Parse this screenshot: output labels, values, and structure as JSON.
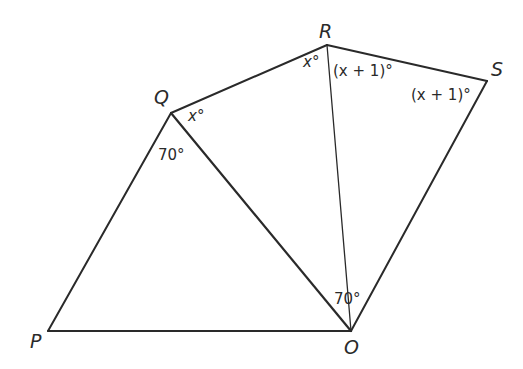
{
  "figure": {
    "vertices": {
      "P": {
        "label": "P",
        "x": 48,
        "y": 331
      },
      "Q": {
        "label": "Q",
        "x": 171,
        "y": 113
      },
      "R": {
        "label": "R",
        "x": 327,
        "y": 45
      },
      "S": {
        "label": "S",
        "x": 487,
        "y": 81
      },
      "O": {
        "label": "O",
        "x": 351,
        "y": 331
      }
    },
    "segments": [
      {
        "from": "P",
        "to": "Q"
      },
      {
        "from": "Q",
        "to": "R"
      },
      {
        "from": "R",
        "to": "S"
      },
      {
        "from": "S",
        "to": "O"
      },
      {
        "from": "O",
        "to": "P"
      },
      {
        "from": "Q",
        "to": "O"
      },
      {
        "from": "R",
        "to": "O"
      }
    ],
    "angle_labels": {
      "angle_RQO": "x°",
      "angle_PQO": "70°",
      "angle_QRO": "x°",
      "angle_ORS": "(x + 1)°",
      "angle_RSO": "(x + 1)°",
      "angle_QOR": "70°"
    },
    "stroke_color": "#2a2a2a"
  }
}
